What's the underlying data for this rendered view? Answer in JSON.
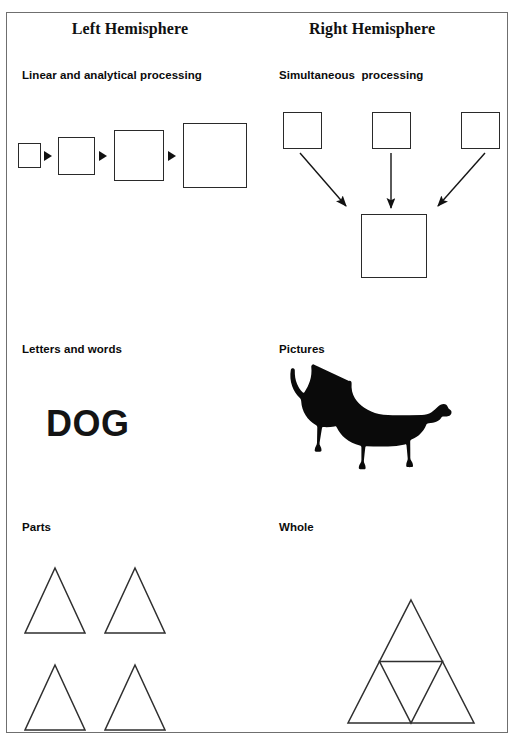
{
  "page": {
    "width": 522,
    "height": 741,
    "background": "#ffffff",
    "frame_border_color": "#6f6f6f"
  },
  "columns": {
    "left": {
      "title": "Left Hemisphere",
      "sections": [
        {
          "label": "Linear and analytical processing",
          "kind": "sequential-squares"
        },
        {
          "label": "Letters and words",
          "kind": "word",
          "word": "DOG"
        },
        {
          "label": "Parts",
          "kind": "separate-triangles",
          "count": 4
        }
      ]
    },
    "right": {
      "title": "Right Hemisphere",
      "sections": [
        {
          "label": "Simultaneous  processing",
          "kind": "converging-squares"
        },
        {
          "label": "Pictures",
          "kind": "dog-silhouette"
        },
        {
          "label": "Whole",
          "kind": "subdivided-triangle"
        }
      ]
    }
  },
  "diagram": {
    "stroke_color": "#2a2a2a",
    "arrow_color": "#111111",
    "sequence_squares": [
      {
        "x": 18,
        "y": 143,
        "w": 23,
        "h": 25
      },
      {
        "x": 58,
        "y": 137,
        "w": 37,
        "h": 38
      },
      {
        "x": 114,
        "y": 130,
        "w": 50,
        "h": 51
      },
      {
        "x": 183,
        "y": 123,
        "w": 64,
        "h": 65
      }
    ],
    "sequence_arrows": [
      {
        "x": 44,
        "y": 151
      },
      {
        "x": 99,
        "y": 151
      },
      {
        "x": 168,
        "y": 151
      }
    ],
    "converge_top_squares": [
      {
        "x": 283,
        "y": 112,
        "w": 39,
        "h": 37
      },
      {
        "x": 372,
        "y": 112,
        "w": 39,
        "h": 37
      },
      {
        "x": 461,
        "y": 112,
        "w": 39,
        "h": 37
      }
    ],
    "converge_bottom_square": {
      "x": 361,
      "y": 214,
      "w": 66,
      "h": 64
    },
    "parts_triangles": [
      {
        "cx": 55,
        "top": 568,
        "half": 30,
        "bottom": 633
      },
      {
        "cx": 135,
        "top": 568,
        "half": 30,
        "bottom": 633
      },
      {
        "cx": 55,
        "top": 665,
        "half": 30,
        "bottom": 730
      },
      {
        "cx": 135,
        "top": 665,
        "half": 30,
        "bottom": 730
      }
    ],
    "whole_triangle": {
      "apex_x": 411,
      "apex_y": 600,
      "left_x": 348,
      "right_x": 474,
      "base_y": 723
    }
  }
}
